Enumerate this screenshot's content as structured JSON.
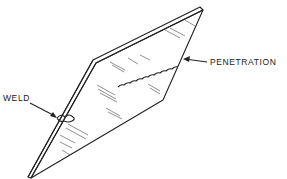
{
  "diagram": {
    "labels": {
      "weld": "WELD",
      "penetration": "PENETRATION"
    },
    "colors": {
      "line": "#222222",
      "background": "#ffffff"
    }
  }
}
